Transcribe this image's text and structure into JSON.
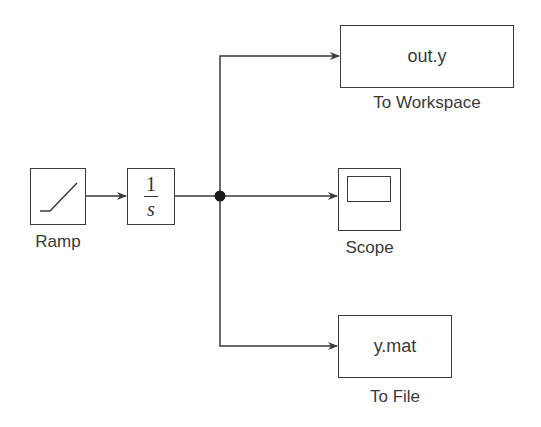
{
  "diagram": {
    "type": "simulink-block-diagram",
    "colors": {
      "line": "#3a3a3a",
      "background": "#ffffff",
      "text": "#3a3a3a"
    },
    "blocks": [
      {
        "id": "ramp",
        "label": "Ramp",
        "icon": "ramp-icon"
      },
      {
        "id": "integrator",
        "label": "",
        "numerator": "1",
        "denominator": "s"
      },
      {
        "id": "to_workspace",
        "label": "To Workspace",
        "content": "out.y"
      },
      {
        "id": "scope",
        "label": "Scope",
        "icon": "scope-icon"
      },
      {
        "id": "to_file",
        "label": "To File",
        "content": "y.mat"
      }
    ],
    "connections": [
      {
        "from": "ramp",
        "to": "integrator"
      },
      {
        "from": "integrator",
        "to": "junction"
      },
      {
        "from": "junction",
        "to": "to_workspace"
      },
      {
        "from": "junction",
        "to": "scope"
      },
      {
        "from": "junction",
        "to": "to_file"
      }
    ]
  }
}
